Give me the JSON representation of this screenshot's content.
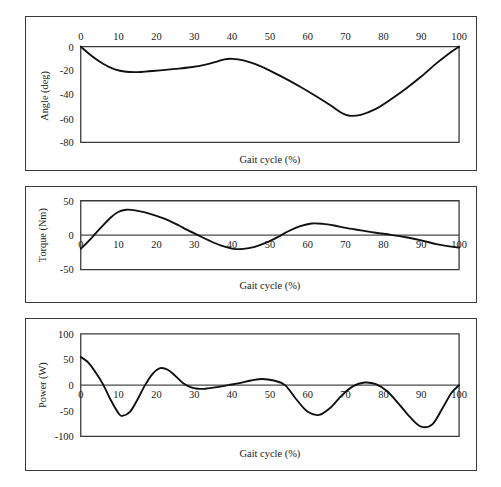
{
  "figure": {
    "panel_count": 3,
    "background_color": "#ffffff",
    "curve_color": "#111111",
    "axis_color": "#3a3a3a"
  },
  "chart_data": [
    {
      "type": "line",
      "name": "angle-panel",
      "title": "",
      "xlabel": "Gait cycle (%)",
      "ylabel": "Angle (deg)",
      "xlim": [
        0,
        100
      ],
      "ylim": [
        -80,
        0
      ],
      "xticks": [
        0,
        10,
        20,
        30,
        40,
        50,
        60,
        70,
        80,
        90,
        100
      ],
      "xtick_labels": [
        "0",
        "10",
        "20",
        "30",
        "40",
        "50",
        "60",
        "70",
        "80",
        "90",
        "100"
      ],
      "yticks": [
        0,
        -20,
        -40,
        -60,
        -80
      ],
      "ytick_labels": [
        "0",
        "-20",
        "-40",
        "-60",
        "-80"
      ],
      "xaxis_position": "top",
      "grid": false,
      "legend": false,
      "x": [
        0,
        3,
        6,
        9,
        12,
        15,
        18,
        21,
        25,
        29,
        33,
        36,
        38,
        40,
        43,
        46,
        50,
        54,
        58,
        62,
        66,
        69,
        71,
        74,
        78,
        82,
        86,
        90,
        94,
        97,
        100
      ],
      "y": [
        0,
        -8,
        -14.5,
        -19,
        -21,
        -21.3,
        -20.6,
        -19.8,
        -18.6,
        -17.2,
        -15,
        -12.5,
        -10.6,
        -10.2,
        -11.5,
        -14.5,
        -20,
        -26.5,
        -33.5,
        -41,
        -49,
        -55.5,
        -57.8,
        -57,
        -52,
        -44,
        -35,
        -25,
        -14,
        -6.5,
        0
      ]
    },
    {
      "type": "line",
      "name": "torque-panel",
      "title": "",
      "xlabel": "Gait cycle (%)",
      "ylabel": "Torque (Nm)",
      "xlim": [
        0,
        100
      ],
      "ylim": [
        -50,
        50
      ],
      "xticks": [
        0,
        10,
        20,
        30,
        40,
        50,
        60,
        70,
        80,
        90,
        100
      ],
      "xtick_labels": [
        "0",
        "10",
        "20",
        "30",
        "40",
        "50",
        "60",
        "70",
        "80",
        "90",
        "100"
      ],
      "yticks": [
        50,
        0,
        -50
      ],
      "ytick_labels": [
        "50",
        "0",
        "-50"
      ],
      "xaxis_position": "zero",
      "grid": false,
      "legend": false,
      "x": [
        0,
        2,
        4,
        6,
        8,
        10,
        12,
        14,
        17,
        20,
        23,
        26,
        28,
        31,
        34,
        37,
        40,
        43,
        46,
        49,
        52,
        55,
        58,
        61,
        64,
        67,
        70,
        74,
        78,
        82,
        86,
        90,
        94,
        97,
        100
      ],
      "y": [
        -20,
        -9,
        3,
        15,
        26,
        34,
        37,
        36.5,
        33,
        28,
        22,
        14,
        8,
        0,
        -8,
        -15,
        -19.5,
        -20,
        -17,
        -11,
        -3,
        6,
        13,
        17,
        16.5,
        14,
        10.5,
        7,
        3.5,
        0.5,
        -3,
        -7.5,
        -13,
        -16,
        -18
      ]
    },
    {
      "type": "line",
      "name": "power-panel",
      "title": "",
      "xlabel": "Gait cycle (%)",
      "ylabel": "Power (W)",
      "xlim": [
        0,
        100
      ],
      "ylim": [
        -100,
        100
      ],
      "xticks": [
        0,
        10,
        20,
        30,
        40,
        50,
        60,
        70,
        80,
        90,
        100
      ],
      "xtick_labels": [
        "0",
        "10",
        "20",
        "30",
        "40",
        "50",
        "60",
        "70",
        "80",
        "90",
        "100"
      ],
      "yticks": [
        100,
        50,
        0,
        -50,
        -100
      ],
      "ytick_labels": [
        "100",
        "50",
        "0",
        "-50",
        "-100"
      ],
      "xaxis_position": "zero",
      "grid": false,
      "legend": false,
      "x": [
        0,
        2,
        4,
        6,
        8,
        10,
        11,
        13,
        15,
        17,
        19,
        21,
        23,
        25,
        27,
        29,
        31,
        33,
        36,
        39,
        42,
        45,
        48,
        51,
        54,
        57,
        60,
        63,
        66,
        69,
        72,
        75,
        78,
        81,
        84,
        87,
        90,
        93,
        96,
        98,
        100
      ],
      "y": [
        55,
        44,
        24,
        0,
        -30,
        -55,
        -60,
        -52,
        -28,
        0,
        22,
        33,
        30,
        18,
        4,
        -4,
        -7,
        -7,
        -4,
        0,
        4,
        9,
        12,
        9,
        0,
        -28,
        -52,
        -58,
        -44,
        -20,
        -2,
        5,
        2,
        -12,
        -36,
        -62,
        -81,
        -76,
        -40,
        -15,
        0
      ]
    }
  ]
}
